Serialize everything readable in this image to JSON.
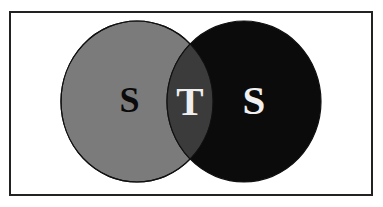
{
  "diagram": {
    "type": "venn",
    "sets": [
      {
        "id": "left",
        "label": "S",
        "fill": "#7b7b7b",
        "label_color": "#0a0a0a",
        "cx": 137,
        "cy": 101.5,
        "rx": 76,
        "ry": 80.5
      },
      {
        "id": "right",
        "label": "S",
        "fill": "#0b0b0b",
        "label_color": "#f0f0f0",
        "cx": 244,
        "cy": 101.5,
        "rx": 77,
        "ry": 80.5
      }
    ],
    "intersection": {
      "label": "T",
      "fill": "#3b3b3b",
      "label_color": "#eeeeee"
    },
    "frame_color": "#222222",
    "outline_color": "#111111"
  }
}
